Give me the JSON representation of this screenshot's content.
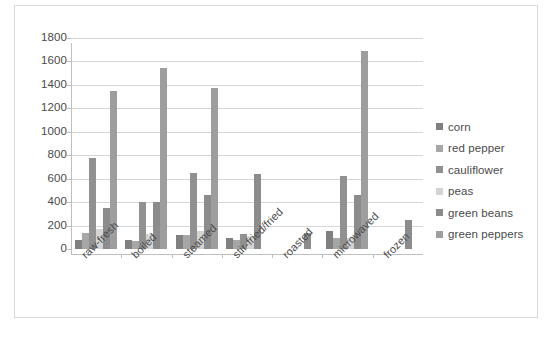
{
  "chart_data": {
    "type": "bar",
    "title": "",
    "subtitle": "",
    "xlabel": "",
    "ylabel": "",
    "ylim": [
      0,
      1800
    ],
    "ytick_step": 200,
    "yticks": [
      1800,
      1600,
      1400,
      1200,
      1000,
      800,
      600,
      400,
      200,
      0
    ],
    "grid": true,
    "legend_position": "right",
    "categories": [
      "raw-fresh",
      "boiled",
      "steamed",
      "stir-fried/fried",
      "roasted",
      "microwaved",
      "frozen"
    ],
    "series": [
      {
        "name": "corn",
        "color": "#808080",
        "values": [
          80,
          75,
          120,
          95,
          null,
          155,
          null
        ]
      },
      {
        "name": "red pepper",
        "color": "#a6a6a6",
        "values": [
          140,
          70,
          120,
          75,
          null,
          95,
          null
        ]
      },
      {
        "name": "cauliflower",
        "color": "#919191",
        "values": [
          775,
          400,
          645,
          130,
          null,
          625,
          null
        ]
      },
      {
        "name": "peas",
        "color": "#d4d4d4",
        "values": [
          175,
          130,
          155,
          110,
          null,
          95,
          null
        ]
      },
      {
        "name": "green beans",
        "color": "#8c8c8c",
        "values": [
          350,
          400,
          465,
          640,
          140,
          460,
          250
        ]
      },
      {
        "name": "green peppers",
        "color": "#9e9e9e",
        "values": [
          1345,
          1540,
          1370,
          null,
          null,
          1690,
          null
        ]
      }
    ]
  },
  "legend": {
    "items": [
      {
        "label": "corn",
        "color": "#808080"
      },
      {
        "label": "red pepper",
        "color": "#a6a6a6"
      },
      {
        "label": "cauliflower",
        "color": "#919191"
      },
      {
        "label": "peas",
        "color": "#d4d4d4"
      },
      {
        "label": "green beans",
        "color": "#8c8c8c"
      },
      {
        "label": "green peppers",
        "color": "#9e9e9e"
      }
    ]
  }
}
